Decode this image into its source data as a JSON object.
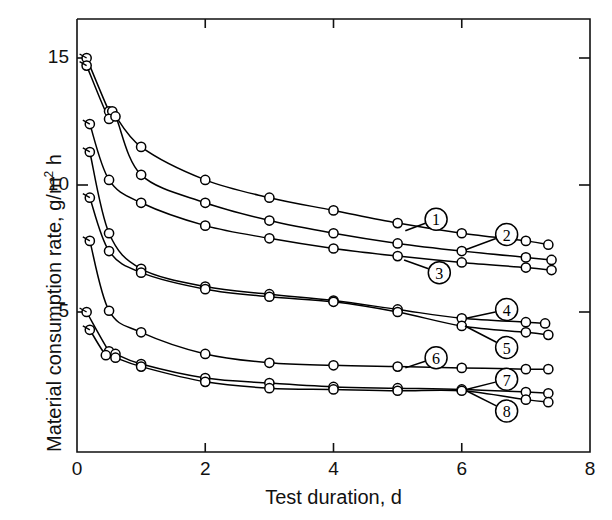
{
  "chart_data": {
    "type": "line",
    "title": "",
    "xlabel": "Test duration, d",
    "ylabel_parts": {
      "pre": "Material consumption rate, g/m",
      "sup": "2",
      "post": " h"
    },
    "ylabel": "Material consumption rate, g/m2 h",
    "xlim": [
      0,
      8
    ],
    "ylim": [
      0,
      16.4
    ],
    "xticks": [
      0,
      2,
      4,
      6,
      8
    ],
    "xticklabels": [
      "0",
      "2",
      "4",
      "6",
      "8"
    ],
    "yticks": [
      5,
      10,
      15
    ],
    "yticklabels": [
      "5",
      "10",
      "15"
    ],
    "grid": false,
    "legend": "inline-curve-labels",
    "marker": "open-circle",
    "line_color": "#000000",
    "series": [
      {
        "name": "1",
        "label": "1",
        "label_pos": {
          "x": 5.6,
          "y": 8.65
        },
        "leader_to": {
          "x": 5.12,
          "y": 8.2
        },
        "x": [
          0.15,
          0.5,
          0.55,
          1.0,
          2.0,
          3.0,
          4.0,
          5.0,
          6.0,
          7.0,
          7.35
        ],
        "y": [
          15.0,
          12.9,
          12.9,
          11.5,
          10.2,
          9.5,
          9.0,
          8.5,
          8.1,
          7.8,
          7.65
        ]
      },
      {
        "name": "2",
        "label": "2",
        "label_pos": {
          "x": 6.7,
          "y": 8.05
        },
        "leader_to": {
          "x": 6.06,
          "y": 7.45
        },
        "x": [
          0.15,
          0.5,
          0.6,
          1.0,
          2.0,
          3.0,
          4.0,
          5.0,
          6.0,
          7.0,
          7.4
        ],
        "y": [
          14.7,
          12.6,
          12.7,
          10.4,
          9.3,
          8.6,
          8.1,
          7.7,
          7.4,
          7.15,
          7.05
        ]
      },
      {
        "name": "3",
        "label": "3",
        "label_pos": {
          "x": 5.65,
          "y": 6.55
        },
        "leader_to": {
          "x": 5.1,
          "y": 7.05
        },
        "x": [
          0.2,
          0.5,
          1.0,
          2.0,
          3.0,
          4.0,
          5.0,
          6.0,
          7.0,
          7.4
        ],
        "y": [
          12.4,
          10.2,
          9.3,
          8.4,
          7.9,
          7.5,
          7.2,
          6.95,
          6.75,
          6.65
        ]
      },
      {
        "name": "4",
        "label": "4",
        "label_pos": {
          "x": 6.7,
          "y": 5.1
        },
        "leader_to": {
          "x": 6.07,
          "y": 4.75
        },
        "x": [
          0.2,
          0.5,
          1.0,
          2.0,
          3.0,
          4.0,
          5.0,
          6.0,
          7.0,
          7.3
        ],
        "y": [
          11.3,
          8.1,
          6.7,
          6.0,
          5.7,
          5.45,
          5.1,
          4.75,
          4.6,
          4.55
        ]
      },
      {
        "name": "5",
        "label": "5",
        "label_pos": {
          "x": 6.7,
          "y": 3.6
        },
        "leader_to": {
          "x": 6.05,
          "y": 4.45
        },
        "x": [
          0.2,
          0.5,
          1.0,
          2.0,
          3.0,
          4.0,
          5.0,
          6.0,
          7.0,
          7.35
        ],
        "y": [
          9.5,
          7.4,
          6.55,
          5.9,
          5.6,
          5.4,
          5.0,
          4.45,
          4.2,
          4.1
        ]
      },
      {
        "name": "6",
        "label": "6",
        "label_pos": {
          "x": 5.6,
          "y": 3.2
        },
        "leader_to": {
          "x": 5.12,
          "y": 2.8
        },
        "x": [
          0.2,
          0.5,
          1.0,
          2.0,
          3.0,
          4.0,
          5.0,
          6.0,
          7.0,
          7.35
        ],
        "y": [
          7.8,
          5.05,
          4.2,
          3.35,
          3.0,
          2.9,
          2.85,
          2.8,
          2.75,
          2.75
        ]
      },
      {
        "name": "7",
        "label": "7",
        "label_pos": {
          "x": 6.7,
          "y": 2.35
        },
        "leader_to": {
          "x": 6.07,
          "y": 1.95
        },
        "x": [
          0.15,
          0.5,
          0.6,
          1.0,
          2.0,
          3.0,
          4.0,
          5.0,
          6.0,
          7.0,
          7.35
        ],
        "y": [
          5.0,
          3.45,
          3.35,
          2.95,
          2.4,
          2.2,
          2.05,
          2.0,
          1.95,
          1.85,
          1.8
        ]
      },
      {
        "name": "8",
        "label": "8",
        "label_pos": {
          "x": 6.7,
          "y": 1.1
        },
        "leader_to": {
          "x": 6.07,
          "y": 1.9
        },
        "x": [
          0.2,
          0.45,
          0.6,
          1.0,
          2.0,
          3.0,
          4.0,
          5.0,
          6.0,
          7.0,
          7.35
        ],
        "y": [
          4.3,
          3.3,
          3.2,
          2.85,
          2.25,
          2.0,
          1.95,
          1.9,
          1.9,
          1.55,
          1.45
        ]
      }
    ]
  }
}
